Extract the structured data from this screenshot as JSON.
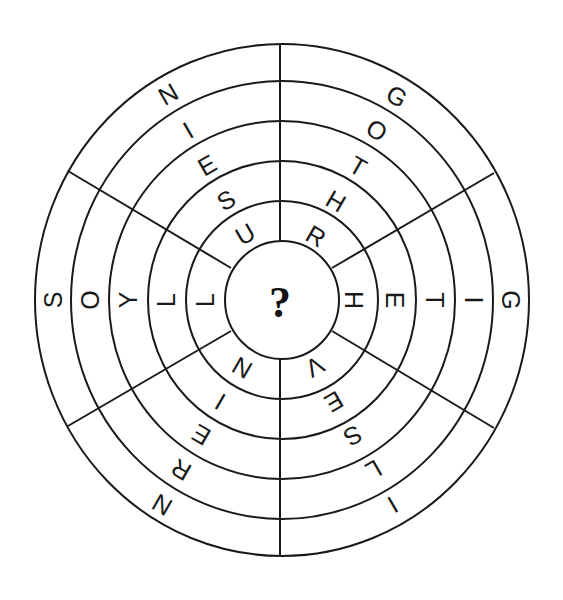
{
  "puzzle": {
    "type": "circular word wheel",
    "center_label": "?",
    "ring_count": 5,
    "sectors": [
      {
        "name": "upper-left",
        "letters_outer_to_inner": [
          "N",
          "I",
          "E",
          "S",
          "U"
        ]
      },
      {
        "name": "upper-right",
        "letters_outer_to_inner": [
          "G",
          "O",
          "T",
          "H",
          "R"
        ]
      },
      {
        "name": "left",
        "letters_outer_to_inner": [
          "S",
          "O",
          "Y",
          "L",
          "L"
        ]
      },
      {
        "name": "right",
        "letters_outer_to_inner": [
          "G",
          "I",
          "T",
          "E",
          "H"
        ]
      },
      {
        "name": "lower-left",
        "letters_outer_to_inner": [
          "N",
          "R",
          "E",
          "I",
          "N"
        ]
      },
      {
        "name": "lower-right",
        "letters_outer_to_inner": [
          "I",
          "L",
          "S",
          "E",
          "V"
        ]
      }
    ]
  },
  "colors": {
    "line": "#1a1a1a",
    "background": "#ffffff"
  }
}
